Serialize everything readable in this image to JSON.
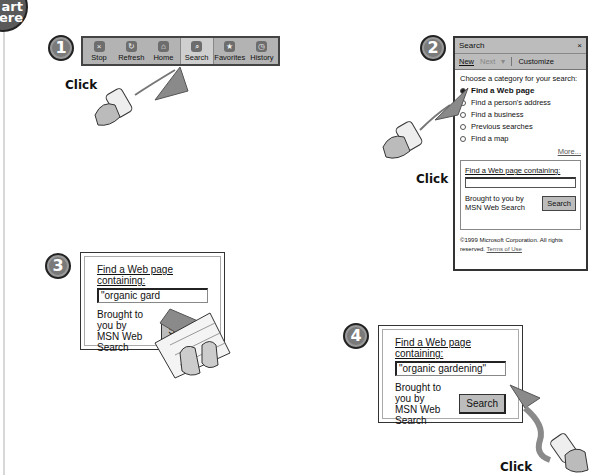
{
  "start_badge": {
    "line1": "art",
    "line2": "ere"
  },
  "step1": {
    "number": "1",
    "toolbar": [
      {
        "label": "Stop",
        "icon": "stop-icon",
        "glyph": "×"
      },
      {
        "label": "Refresh",
        "icon": "refresh-icon",
        "glyph": "↻"
      },
      {
        "label": "Home",
        "icon": "home-icon",
        "glyph": "⌂"
      },
      {
        "label": "Search",
        "icon": "search-icon",
        "glyph": "⌕",
        "active": true
      },
      {
        "label": "Favorites",
        "icon": "favorites-icon",
        "glyph": "★"
      },
      {
        "label": "History",
        "icon": "history-icon",
        "glyph": "◷"
      }
    ],
    "action": "Click"
  },
  "step2": {
    "number": "2",
    "pane": {
      "title": "Search",
      "close": "×",
      "toolbar": {
        "new": "New",
        "next": "Next",
        "next_caret": "▾",
        "customize": "Customize"
      },
      "prompt": "Choose a category for your search:",
      "options": [
        {
          "label": "Find a Web page",
          "selected": true
        },
        {
          "label": "Find a person's address",
          "selected": false
        },
        {
          "label": "Find a business",
          "selected": false
        },
        {
          "label": "Previous searches",
          "selected": false
        },
        {
          "label": "Find a map",
          "selected": false
        }
      ],
      "more": "More...",
      "field_label": "Find a Web page containing:",
      "field_value": "",
      "provider_line1": "Brought to you by",
      "provider_line2": "MSN Web Search",
      "search_button": "Search",
      "copyright": "©1999 Microsoft Corporation. All rights reserved.",
      "terms": "Terms of Use"
    },
    "action": "Click"
  },
  "step3": {
    "number": "3",
    "field_label": "Find a Web page containing:",
    "field_value": "\"organic gard",
    "provider_line1": "Brought to you by",
    "provider_line2": "MSN Web Search",
    "search_button": "Search"
  },
  "step4": {
    "number": "4",
    "field_label": "Find a Web page containing:",
    "field_value": "\"organic gardening\"",
    "provider_line1": "Brought to you by",
    "provider_line2": "MSN Web Search",
    "search_button": "Search",
    "action": "Click"
  },
  "colors": {
    "badge": "#7a7a7a",
    "toolbar": "#b3b3b3",
    "arrow": "#8a8a8a"
  }
}
